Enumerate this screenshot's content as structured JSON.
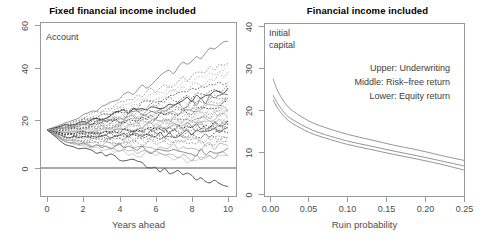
{
  "figure": {
    "width": 490,
    "height": 247,
    "background": "#ffffff",
    "axis_color": "#9a9a9a",
    "text_color": "#4d4d4d"
  },
  "chart_data": [
    {
      "type": "line",
      "panel": "left",
      "title": "Fixed financial income included",
      "xlabel": "Years ahead",
      "ylabel": "",
      "annotation": "Account",
      "xlim": [
        0,
        10
      ],
      "ylim": [
        -12,
        62
      ],
      "xticks": [
        0,
        2,
        4,
        6,
        8,
        10
      ],
      "xticklabels": [
        "0",
        "2",
        "4",
        "6",
        "8",
        "10"
      ],
      "yticks": [
        0,
        20,
        40,
        60
      ],
      "yticklabels": [
        "0",
        "20",
        "40",
        "60"
      ],
      "grid": false,
      "legend": "none",
      "description": "Monte-Carlo simulated account value paths starting at 16, fanning out over 10 years; a solid horizontal reference line is drawn at 0.",
      "reference_line_y": 0,
      "start_value": 16,
      "series": [
        {
          "name": "path-01",
          "x": [
            0,
            1,
            2,
            3,
            4,
            5,
            6,
            7,
            8,
            9,
            10
          ],
          "values": [
            16,
            19,
            22,
            25,
            29,
            33,
            37,
            41,
            45,
            49,
            53
          ]
        },
        {
          "name": "path-02",
          "x": [
            0,
            1,
            2,
            3,
            4,
            5,
            6,
            7,
            8,
            9,
            10
          ],
          "values": [
            16,
            18,
            21,
            24,
            27,
            30,
            33,
            36,
            38,
            41,
            44
          ]
        },
        {
          "name": "path-03",
          "x": [
            0,
            1,
            2,
            3,
            4,
            5,
            6,
            7,
            8,
            9,
            10
          ],
          "values": [
            16,
            18,
            20,
            23,
            26,
            28,
            31,
            34,
            37,
            39,
            43
          ]
        },
        {
          "name": "path-04",
          "x": [
            0,
            1,
            2,
            3,
            4,
            5,
            6,
            7,
            8,
            9,
            10
          ],
          "values": [
            16,
            18,
            21,
            22,
            25,
            27,
            29,
            32,
            34,
            37,
            40
          ]
        },
        {
          "name": "path-05",
          "x": [
            0,
            1,
            2,
            3,
            4,
            5,
            6,
            7,
            8,
            9,
            10
          ],
          "values": [
            16,
            17,
            19,
            21,
            24,
            26,
            28,
            30,
            32,
            34,
            36
          ]
        },
        {
          "name": "path-06",
          "x": [
            0,
            1,
            2,
            3,
            4,
            5,
            6,
            7,
            8,
            9,
            10
          ],
          "values": [
            16,
            17,
            20,
            22,
            23,
            25,
            27,
            29,
            30,
            32,
            34
          ]
        },
        {
          "name": "path-07",
          "x": [
            0,
            1,
            2,
            3,
            4,
            5,
            6,
            7,
            8,
            9,
            10
          ],
          "values": [
            16,
            18,
            19,
            21,
            23,
            24,
            26,
            27,
            29,
            31,
            33
          ]
        },
        {
          "name": "path-08",
          "x": [
            0,
            1,
            2,
            3,
            4,
            5,
            6,
            7,
            8,
            9,
            10
          ],
          "values": [
            16,
            17,
            19,
            20,
            22,
            23,
            25,
            26,
            28,
            30,
            32
          ]
        },
        {
          "name": "path-09",
          "x": [
            0,
            1,
            2,
            3,
            4,
            5,
            6,
            7,
            8,
            9,
            10
          ],
          "values": [
            16,
            17,
            18,
            20,
            21,
            23,
            24,
            26,
            27,
            29,
            31
          ]
        },
        {
          "name": "path-10",
          "x": [
            0,
            1,
            2,
            3,
            4,
            5,
            6,
            7,
            8,
            9,
            10
          ],
          "values": [
            16,
            17,
            19,
            20,
            21,
            22,
            24,
            25,
            26,
            28,
            29
          ]
        },
        {
          "name": "path-11",
          "x": [
            0,
            1,
            2,
            3,
            4,
            5,
            6,
            7,
            8,
            9,
            10
          ],
          "values": [
            16,
            16,
            18,
            19,
            20,
            22,
            23,
            24,
            25,
            27,
            28
          ]
        },
        {
          "name": "path-12",
          "x": [
            0,
            1,
            2,
            3,
            4,
            5,
            6,
            7,
            8,
            9,
            10
          ],
          "values": [
            16,
            17,
            18,
            19,
            20,
            21,
            22,
            23,
            25,
            26,
            28
          ]
        },
        {
          "name": "path-13",
          "x": [
            0,
            1,
            2,
            3,
            4,
            5,
            6,
            7,
            8,
            9,
            10
          ],
          "values": [
            16,
            16,
            17,
            19,
            20,
            20,
            22,
            23,
            24,
            25,
            27
          ]
        },
        {
          "name": "path-14",
          "x": [
            0,
            1,
            2,
            3,
            4,
            5,
            6,
            7,
            8,
            9,
            10
          ],
          "values": [
            16,
            17,
            18,
            18,
            19,
            20,
            21,
            22,
            23,
            24,
            26
          ]
        },
        {
          "name": "path-15",
          "x": [
            0,
            1,
            2,
            3,
            4,
            5,
            6,
            7,
            8,
            9,
            10
          ],
          "values": [
            16,
            16,
            17,
            18,
            19,
            19,
            20,
            21,
            22,
            23,
            25
          ]
        },
        {
          "name": "path-16",
          "x": [
            0,
            1,
            2,
            3,
            4,
            5,
            6,
            7,
            8,
            9,
            10
          ],
          "values": [
            16,
            16,
            17,
            17,
            18,
            19,
            20,
            20,
            21,
            22,
            24
          ]
        },
        {
          "name": "path-17",
          "x": [
            0,
            1,
            2,
            3,
            4,
            5,
            6,
            7,
            8,
            9,
            10
          ],
          "values": [
            16,
            16,
            16,
            17,
            18,
            18,
            19,
            20,
            21,
            22,
            23
          ]
        },
        {
          "name": "path-18",
          "x": [
            0,
            1,
            2,
            3,
            4,
            5,
            6,
            7,
            8,
            9,
            10
          ],
          "values": [
            16,
            15,
            16,
            17,
            17,
            18,
            18,
            19,
            20,
            21,
            22
          ]
        },
        {
          "name": "path-19",
          "x": [
            0,
            1,
            2,
            3,
            4,
            5,
            6,
            7,
            8,
            9,
            10
          ],
          "values": [
            16,
            15,
            16,
            16,
            17,
            17,
            18,
            18,
            19,
            20,
            21
          ]
        },
        {
          "name": "path-20",
          "x": [
            0,
            1,
            2,
            3,
            4,
            5,
            6,
            7,
            8,
            9,
            10
          ],
          "values": [
            16,
            15,
            15,
            16,
            16,
            17,
            17,
            18,
            18,
            19,
            20
          ]
        },
        {
          "name": "path-21",
          "x": [
            0,
            1,
            2,
            3,
            4,
            5,
            6,
            7,
            8,
            9,
            10
          ],
          "values": [
            16,
            15,
            15,
            15,
            16,
            16,
            17,
            17,
            18,
            18,
            19
          ]
        },
        {
          "name": "path-22",
          "x": [
            0,
            1,
            2,
            3,
            4,
            5,
            6,
            7,
            8,
            9,
            10
          ],
          "values": [
            16,
            14,
            15,
            15,
            15,
            16,
            16,
            17,
            17,
            18,
            19
          ]
        },
        {
          "name": "path-23",
          "x": [
            0,
            1,
            2,
            3,
            4,
            5,
            6,
            7,
            8,
            9,
            10
          ],
          "values": [
            16,
            14,
            14,
            15,
            15,
            15,
            16,
            16,
            17,
            17,
            18
          ]
        },
        {
          "name": "path-24",
          "x": [
            0,
            1,
            2,
            3,
            4,
            5,
            6,
            7,
            8,
            9,
            10
          ],
          "values": [
            16,
            14,
            14,
            14,
            15,
            15,
            15,
            16,
            16,
            17,
            17
          ]
        },
        {
          "name": "path-25",
          "x": [
            0,
            1,
            2,
            3,
            4,
            5,
            6,
            7,
            8,
            9,
            10
          ],
          "values": [
            16,
            14,
            14,
            14,
            14,
            14,
            15,
            15,
            15,
            16,
            16
          ]
        },
        {
          "name": "path-26",
          "x": [
            0,
            1,
            2,
            3,
            4,
            5,
            6,
            7,
            8,
            9,
            10
          ],
          "values": [
            16,
            13,
            13,
            13,
            14,
            14,
            14,
            14,
            15,
            15,
            16
          ]
        },
        {
          "name": "path-27",
          "x": [
            0,
            1,
            2,
            3,
            4,
            5,
            6,
            7,
            8,
            9,
            10
          ],
          "values": [
            16,
            13,
            13,
            13,
            13,
            13,
            13,
            14,
            14,
            14,
            15
          ]
        },
        {
          "name": "path-28",
          "x": [
            0,
            1,
            2,
            3,
            4,
            5,
            6,
            7,
            8,
            9,
            10
          ],
          "values": [
            16,
            13,
            12,
            12,
            12,
            13,
            13,
            13,
            13,
            13,
            14
          ]
        },
        {
          "name": "path-29",
          "x": [
            0,
            1,
            2,
            3,
            4,
            5,
            6,
            7,
            8,
            9,
            10
          ],
          "values": [
            16,
            12,
            12,
            12,
            11,
            12,
            12,
            12,
            12,
            12,
            12
          ]
        },
        {
          "name": "path-30",
          "x": [
            0,
            1,
            2,
            3,
            4,
            5,
            6,
            7,
            8,
            9,
            10
          ],
          "values": [
            16,
            12,
            11,
            11,
            11,
            10,
            11,
            11,
            10,
            11,
            11
          ]
        },
        {
          "name": "path-31",
          "x": [
            0,
            1,
            2,
            3,
            4,
            5,
            6,
            7,
            8,
            9,
            10
          ],
          "values": [
            16,
            12,
            11,
            10,
            10,
            9,
            9,
            9,
            8,
            9,
            10
          ]
        },
        {
          "name": "path-32",
          "x": [
            0,
            1,
            2,
            3,
            4,
            5,
            6,
            7,
            8,
            9,
            10
          ],
          "values": [
            16,
            11,
            10,
            9,
            9,
            8,
            7,
            7,
            6,
            7,
            8
          ]
        },
        {
          "name": "path-33",
          "x": [
            0,
            1,
            2,
            3,
            4,
            5,
            6,
            7,
            8,
            9,
            10
          ],
          "values": [
            16,
            11,
            10,
            9,
            8,
            7,
            6,
            5,
            4,
            5,
            6
          ]
        },
        {
          "name": "path-34",
          "x": [
            0,
            1,
            2,
            3,
            4,
            5,
            6,
            7,
            8,
            9,
            10
          ],
          "values": [
            16,
            11,
            9,
            8,
            7,
            6,
            5,
            4,
            3,
            4,
            5
          ]
        },
        {
          "name": "path-35",
          "x": [
            0,
            1,
            2,
            3,
            4,
            5,
            6,
            7,
            8,
            9,
            10
          ],
          "values": [
            16,
            10,
            8,
            6,
            4,
            2,
            0,
            -2,
            -4,
            -6,
            -7
          ]
        }
      ]
    },
    {
      "type": "line",
      "panel": "right",
      "title": "Financial income included",
      "xlabel": "Ruin probability",
      "ylabel": "",
      "annotation": "Initial\ncapital",
      "xlim": [
        0.0,
        0.25
      ],
      "ylim": [
        0,
        40
      ],
      "xticks": [
        0.0,
        0.05,
        0.1,
        0.15,
        0.2,
        0.25
      ],
      "xticklabels": [
        "0.00",
        "0.05",
        "0.10",
        "0.15",
        "0.20",
        "0.25"
      ],
      "yticks": [
        0,
        10,
        20,
        30,
        40
      ],
      "yticklabels": [
        "0",
        "10",
        "20",
        "30",
        "40"
      ],
      "grid": false,
      "legend": "text-block",
      "legend_entries": [
        "Upper: Underwriting",
        "Middle: Risk–free return",
        "Lower: Equity return"
      ],
      "x": [
        0.004,
        0.01,
        0.02,
        0.03,
        0.05,
        0.07,
        0.1,
        0.13,
        0.16,
        0.19,
        0.22,
        0.25
      ],
      "series": [
        {
          "name": "Upper: Underwriting",
          "values": [
            27.5,
            24.5,
            21.5,
            19.7,
            17.4,
            15.9,
            14.2,
            12.9,
            11.6,
            10.5,
            9.2,
            8.0
          ]
        },
        {
          "name": "Middle: Risk–free return",
          "values": [
            23.5,
            21.5,
            19.0,
            17.6,
            15.6,
            14.2,
            12.6,
            11.4,
            10.2,
            9.1,
            7.9,
            6.7
          ]
        },
        {
          "name": "Lower: Equity return",
          "values": [
            22.4,
            20.4,
            18.1,
            16.7,
            14.7,
            13.4,
            11.8,
            10.6,
            9.4,
            8.3,
            7.1,
            5.7
          ]
        }
      ]
    }
  ],
  "left_panel": {
    "title": "Fixed financial income included",
    "annotation": "Account",
    "xlabel": "Years ahead",
    "xticklabels": [
      "0",
      "2",
      "4",
      "6",
      "8",
      "10"
    ],
    "yticklabels": [
      "0",
      "20",
      "40",
      "60"
    ]
  },
  "right_panel": {
    "title": "Financial income included",
    "annotation_line1": "Initial",
    "annotation_line2": "capital",
    "xlabel": "Ruin probability",
    "xticklabels": [
      "0.00",
      "0.05",
      "0.10",
      "0.15",
      "0.20",
      "0.25"
    ],
    "yticklabels": [
      "0",
      "10",
      "20",
      "30",
      "40"
    ],
    "legend": {
      "line1": "Upper: Underwriting",
      "line2": "Middle: Risk–free return",
      "line3": "Lower: Equity return"
    }
  }
}
